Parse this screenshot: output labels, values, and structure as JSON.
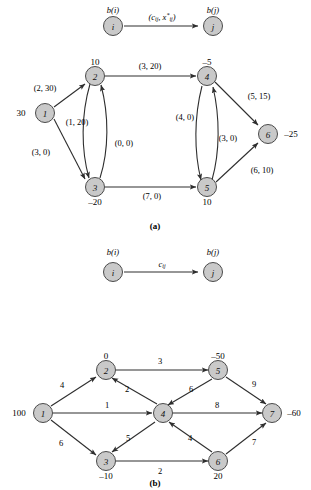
{
  "figure": {
    "background_color": "#ffffff",
    "node_fill": "#c9c9c9",
    "node_stroke": "#4a4a4a",
    "edge_color": "#2e2e2e"
  },
  "panel_a": {
    "caption": "(a)",
    "legend": {
      "source_supply": "b(i)",
      "source_node": "i",
      "edge_label_main": "(c",
      "edge_label_sub1": "ij",
      "edge_label_mid": ", x",
      "edge_label_sup": "*",
      "edge_label_sub2": "ij",
      "edge_label_end": ")",
      "target_supply": "b(j)",
      "target_node": "j"
    },
    "nodes": [
      {
        "id": "1",
        "supply": "30"
      },
      {
        "id": "2",
        "supply": "10"
      },
      {
        "id": "3",
        "supply": "–20"
      },
      {
        "id": "4",
        "supply": "–5"
      },
      {
        "id": "5",
        "supply": "10"
      },
      {
        "id": "6",
        "supply": "–25"
      }
    ],
    "edges": [
      {
        "from": "1",
        "to": "2",
        "label": "(2, 30)",
        "cost": 2,
        "flow": 30
      },
      {
        "from": "1",
        "to": "3",
        "label": "(3, 0)",
        "cost": 3,
        "flow": 0
      },
      {
        "from": "2",
        "to": "3",
        "label": "(1, 20)",
        "cost": 1,
        "flow": 20
      },
      {
        "from": "3",
        "to": "2",
        "label": "(0, 0)",
        "cost": 0,
        "flow": 0
      },
      {
        "from": "2",
        "to": "4",
        "label": "(3, 20)",
        "cost": 3,
        "flow": 20
      },
      {
        "from": "3",
        "to": "5",
        "label": "(7, 0)",
        "cost": 7,
        "flow": 0
      },
      {
        "from": "4",
        "to": "5",
        "label": "(4, 0)",
        "cost": 4,
        "flow": 0
      },
      {
        "from": "5",
        "to": "4",
        "label": "(3, 0)",
        "cost": 3,
        "flow": 0
      },
      {
        "from": "4",
        "to": "6",
        "label": "(5, 15)",
        "cost": 5,
        "flow": 15
      },
      {
        "from": "5",
        "to": "6",
        "label": "(6, 10)",
        "cost": 6,
        "flow": 10
      }
    ]
  },
  "panel_b": {
    "caption": "(b)",
    "legend": {
      "source_supply": "b(i)",
      "source_node": "i",
      "edge_label_main": "c",
      "edge_label_sub": "ij",
      "target_supply": "b(j)",
      "target_node": "j"
    },
    "nodes": [
      {
        "id": "1",
        "supply": "100"
      },
      {
        "id": "2",
        "supply": "0"
      },
      {
        "id": "3",
        "supply": "–10"
      },
      {
        "id": "4",
        "supply": ""
      },
      {
        "id": "5",
        "supply": "–50"
      },
      {
        "id": "6",
        "supply": "20"
      },
      {
        "id": "7",
        "supply": "–60"
      }
    ],
    "edges": [
      {
        "from": "1",
        "to": "2",
        "label": "4",
        "cost": 4
      },
      {
        "from": "1",
        "to": "3",
        "label": "6",
        "cost": 6
      },
      {
        "from": "1",
        "to": "4",
        "label": "1",
        "cost": 1
      },
      {
        "from": "2",
        "to": "5",
        "label": "3",
        "cost": 3
      },
      {
        "from": "4",
        "to": "2",
        "label": "2",
        "cost": 2
      },
      {
        "from": "5",
        "to": "4",
        "label": "6",
        "cost": 6
      },
      {
        "from": "4",
        "to": "3",
        "label": "5",
        "cost": 5
      },
      {
        "from": "6",
        "to": "4",
        "label": "4",
        "cost": 4
      },
      {
        "from": "3",
        "to": "6",
        "label": "2",
        "cost": 2
      },
      {
        "from": "4",
        "to": "7",
        "label": "8",
        "cost": 8
      },
      {
        "from": "5",
        "to": "7",
        "label": "9",
        "cost": 9
      },
      {
        "from": "6",
        "to": "7",
        "label": "7",
        "cost": 7
      }
    ]
  }
}
